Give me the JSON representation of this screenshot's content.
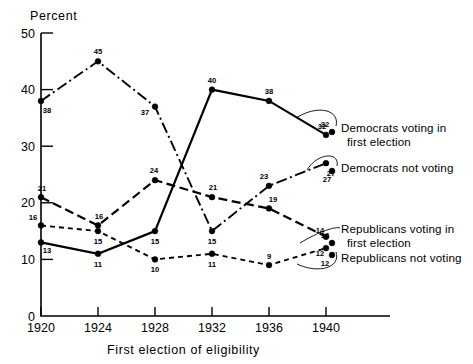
{
  "chart_data": {
    "type": "line",
    "title": "",
    "xlabel": "First election of eligibility",
    "ylabel": "Percent",
    "categories": [
      "1920",
      "1924",
      "1928",
      "1932",
      "1936",
      "1940"
    ],
    "x": [
      1920,
      1924,
      1928,
      1932,
      1936,
      1940
    ],
    "xlim": [
      1920,
      1942
    ],
    "ylim": [
      0,
      50
    ],
    "ytick_labels": [
      "0",
      "10",
      "20",
      "30",
      "40",
      "50"
    ],
    "yticks": [
      0,
      10,
      20,
      30,
      40,
      50
    ],
    "grid": false,
    "legend_position": "right-inline-annotations",
    "series": [
      {
        "name": "Democrats voting in first election",
        "label_line1": "Democrats voting in",
        "label_line2": "first election",
        "style": "solid",
        "values": [
          13,
          11,
          15,
          40,
          38,
          32
        ],
        "point_labels": [
          "13",
          "11",
          "15",
          "40",
          "38",
          "32"
        ]
      },
      {
        "name": "Democrats not voting",
        "label_line1": "Democrats not voting",
        "label_line2": "",
        "style": "dash-dot",
        "values": [
          38,
          45,
          37,
          15,
          23,
          27
        ],
        "point_labels": [
          "38",
          "45",
          "37",
          "15",
          "23",
          "27"
        ]
      },
      {
        "name": "Republicans voting in first election",
        "label_line1": "Republicans voting in",
        "label_line2": "first election",
        "style": "long-dash",
        "values": [
          21,
          16,
          24,
          21,
          19,
          14
        ],
        "point_labels": [
          "21",
          "16",
          "24",
          "21",
          "19",
          "14"
        ]
      },
      {
        "name": "Republicans not voting",
        "label_line1": "Republicans not voting",
        "label_line2": "",
        "style": "short-dash",
        "values": [
          16,
          15,
          10,
          11,
          9,
          12
        ],
        "point_labels": [
          "16",
          "15",
          "10",
          "11",
          "9",
          "12"
        ]
      }
    ],
    "colors": {
      "ink": "#000000",
      "background": "#ffffff"
    }
  }
}
